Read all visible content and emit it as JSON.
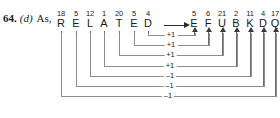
{
  "figure": {
    "lead": {
      "number": "64.",
      "option": "(d)",
      "text": "As,"
    },
    "top_sliver_text": "",
    "arrow_glyph": "⟶",
    "plaintext_word": "RELATED",
    "ciphertext_word": "EFUBKDQ",
    "plaintext_columns": [
      {
        "num": "18",
        "letter": "R"
      },
      {
        "num": "5",
        "letter": "E"
      },
      {
        "num": "12",
        "letter": "L"
      },
      {
        "num": "1",
        "letter": "A"
      },
      {
        "num": "20",
        "letter": "T"
      },
      {
        "num": "5",
        "letter": "E"
      },
      {
        "num": "4",
        "letter": "D"
      }
    ],
    "ciphertext_columns": [
      {
        "num": "5",
        "letter": "E"
      },
      {
        "num": "6",
        "letter": "F"
      },
      {
        "num": "21",
        "letter": "U"
      },
      {
        "num": "2",
        "letter": "B"
      },
      {
        "num": "11",
        "letter": "K"
      },
      {
        "num": "4",
        "letter": "D"
      },
      {
        "num": "17",
        "letter": "Q"
      }
    ],
    "shift_brackets": [
      {
        "label": "+1",
        "from_letter": "D",
        "to_letter": "E"
      },
      {
        "label": "+1",
        "from_letter": "E",
        "to_letter": "F"
      },
      {
        "label": "+1",
        "from_letter": "T",
        "to_letter": "U"
      },
      {
        "label": "+1",
        "from_letter": "A",
        "to_letter": "B"
      },
      {
        "label": "–1",
        "from_letter": "L",
        "to_letter": "K"
      },
      {
        "label": "–1",
        "from_letter": "E",
        "to_letter": "D"
      },
      {
        "label": "–1",
        "from_letter": "R",
        "to_letter": "Q"
      }
    ],
    "colors": {
      "background": "#ffffff",
      "text": "#1a1a1a",
      "line": "#6e6e6e",
      "bracket": "#8d8d8d",
      "arrow": "#2b2b2b"
    }
  },
  "chart_data": {
    "type": "diagram",
    "plaintext": {
      "letters": [
        "R",
        "E",
        "L",
        "A",
        "T",
        "E",
        "D"
      ],
      "values": [
        18,
        5,
        12,
        1,
        20,
        5,
        4
      ]
    },
    "ciphertext": {
      "letters": [
        "E",
        "F",
        "U",
        "B",
        "K",
        "D",
        "Q"
      ],
      "values": [
        5,
        6,
        21,
        2,
        11,
        4,
        17
      ]
    },
    "shifts": [
      "+1",
      "+1",
      "+1",
      "+1",
      "-1",
      "-1",
      "-1"
    ],
    "pairings": [
      {
        "plain": "D",
        "plain_value": 4,
        "cipher": "E",
        "cipher_value": 5,
        "shift": "+1"
      },
      {
        "plain": "E",
        "plain_value": 5,
        "cipher": "F",
        "cipher_value": 6,
        "shift": "+1"
      },
      {
        "plain": "T",
        "plain_value": 20,
        "cipher": "U",
        "cipher_value": 21,
        "shift": "+1"
      },
      {
        "plain": "A",
        "plain_value": 1,
        "cipher": "B",
        "cipher_value": 2,
        "shift": "+1"
      },
      {
        "plain": "L",
        "plain_value": 12,
        "cipher": "K",
        "cipher_value": 11,
        "shift": "-1"
      },
      {
        "plain": "E",
        "plain_value": 5,
        "cipher": "D",
        "cipher_value": 4,
        "shift": "-1"
      },
      {
        "plain": "R",
        "plain_value": 18,
        "cipher": "Q",
        "cipher_value": 17,
        "shift": "-1"
      }
    ]
  }
}
